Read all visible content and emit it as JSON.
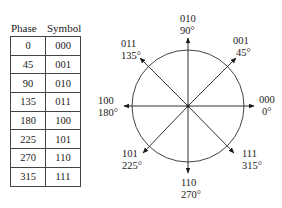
{
  "table": {
    "headers": [
      "Phase",
      "Symbol"
    ],
    "rows": [
      {
        "phase": "0",
        "symbol": "000"
      },
      {
        "phase": "45",
        "symbol": "001"
      },
      {
        "phase": "90",
        "symbol": "010"
      },
      {
        "phase": "135",
        "symbol": "011"
      },
      {
        "phase": "180",
        "symbol": "100"
      },
      {
        "phase": "225",
        "symbol": "101"
      },
      {
        "phase": "270",
        "symbol": "110"
      },
      {
        "phase": "315",
        "symbol": "111"
      }
    ]
  },
  "constellation": {
    "points": [
      {
        "symbol": "000",
        "angle": "0°"
      },
      {
        "symbol": "001",
        "angle": "45°"
      },
      {
        "symbol": "010",
        "angle": "90°"
      },
      {
        "symbol": "011",
        "angle": "135°"
      },
      {
        "symbol": "100",
        "angle": "180°"
      },
      {
        "symbol": "101",
        "angle": "225°"
      },
      {
        "symbol": "110",
        "angle": "270°"
      },
      {
        "symbol": "111",
        "angle": "315°"
      }
    ]
  }
}
